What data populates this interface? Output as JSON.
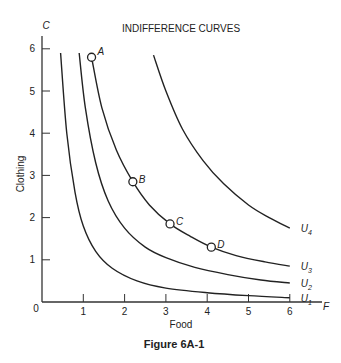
{
  "chart_data": {
    "type": "line",
    "title": "INDIFFERENCE CURVES",
    "caption": "Figure 6A-1",
    "xlabel": "Food",
    "ylabel": "Clothing",
    "x_axis_symbol": "F",
    "y_axis_symbol": "C",
    "origin_label": "0",
    "xlim": [
      0,
      6.8
    ],
    "ylim": [
      0,
      6.4
    ],
    "x_ticks": [
      "1",
      "2",
      "3",
      "4",
      "5",
      "6"
    ],
    "y_ticks": [
      "1",
      "2",
      "3",
      "4",
      "5",
      "6"
    ],
    "grid": false,
    "series": [
      {
        "name": "U1",
        "label_main": "U",
        "label_sub": "1",
        "points": [
          [
            0.45,
            5.9
          ],
          [
            0.6,
            4.0
          ],
          [
            0.8,
            2.6
          ],
          [
            1.0,
            1.8
          ],
          [
            1.3,
            1.2
          ],
          [
            1.7,
            0.8
          ],
          [
            2.3,
            0.5
          ],
          [
            3.0,
            0.33
          ],
          [
            4.0,
            0.22
          ],
          [
            5.0,
            0.15
          ],
          [
            6.0,
            0.1
          ]
        ]
      },
      {
        "name": "U2",
        "label_main": "U",
        "label_sub": "2",
        "points": [
          [
            0.9,
            5.9
          ],
          [
            1.05,
            4.6
          ],
          [
            1.3,
            3.3
          ],
          [
            1.6,
            2.4
          ],
          [
            2.0,
            1.75
          ],
          [
            2.5,
            1.3
          ],
          [
            3.0,
            1.05
          ],
          [
            3.7,
            0.82
          ],
          [
            4.5,
            0.65
          ],
          [
            5.3,
            0.52
          ],
          [
            6.0,
            0.45
          ]
        ]
      },
      {
        "name": "U3",
        "label_main": "U",
        "label_sub": "3",
        "points": [
          [
            1.2,
            5.8
          ],
          [
            1.45,
            4.6
          ],
          [
            1.8,
            3.6
          ],
          [
            2.2,
            2.85
          ],
          [
            2.6,
            2.3
          ],
          [
            3.1,
            1.85
          ],
          [
            3.6,
            1.55
          ],
          [
            4.1,
            1.3
          ],
          [
            4.7,
            1.1
          ],
          [
            5.4,
            0.95
          ],
          [
            6.0,
            0.85
          ]
        ]
      },
      {
        "name": "U4",
        "label_main": "U",
        "label_sub": "4",
        "points": [
          [
            2.7,
            5.85
          ],
          [
            3.0,
            5.0
          ],
          [
            3.4,
            4.1
          ],
          [
            3.9,
            3.35
          ],
          [
            4.4,
            2.8
          ],
          [
            5.0,
            2.3
          ],
          [
            5.5,
            2.0
          ],
          [
            6.0,
            1.75
          ]
        ]
      }
    ],
    "marked_points": [
      {
        "label": "A",
        "x": 1.2,
        "y": 5.8
      },
      {
        "label": "B",
        "x": 2.2,
        "y": 2.85
      },
      {
        "label": "C",
        "x": 3.1,
        "y": 1.85
      },
      {
        "label": "D",
        "x": 4.1,
        "y": 1.3
      }
    ],
    "legend_position": "curve-end labels"
  }
}
